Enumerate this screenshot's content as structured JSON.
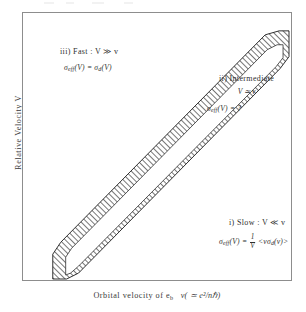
{
  "figure": {
    "type": "schematic-diagram",
    "axes": {
      "y_label": "Relative Velocity V",
      "x_label_text": "Orbital velocity of e",
      "x_label_subscript": "b",
      "x_label_expression": "v( ≃ e²/nℏ)"
    },
    "regions": [
      {
        "id": "fast",
        "numeral": "iii) Fast :",
        "condition": "V ≫ v",
        "title": "iii) Fast : V ≫ v",
        "formula_lhs": "σ",
        "formula_lhs_sub": "eff",
        "formula": "σeff(V) = σd(V)",
        "formula_rhs": "σ",
        "formula_rhs_sub": "d",
        "formula_arg": "(V)",
        "position": "upper-left"
      },
      {
        "id": "intermediate",
        "numeral": "ii) Intermediate",
        "condition": "V ≃ v",
        "title": "ii) Intermediate",
        "formula": "σeff(V) = ?",
        "formula_lhs": "σ",
        "formula_lhs_sub": "eff",
        "formula_arg": "(V)",
        "formula_rhs": "?",
        "position": "center-diagonal-band"
      },
      {
        "id": "slow",
        "numeral": "i) Slow :",
        "condition": "V ≪ v",
        "title": "i) Slow : V ≪ v",
        "formula": "σeff(V) = (1/V)⟨vσd(v)⟩",
        "formula_lhs": "σ",
        "formula_lhs_sub": "eff",
        "formula_arg": "(V)",
        "fraction_numerator": "1",
        "fraction_denominator": "V",
        "bracket_expr": "⟨ vσd(v) ⟩",
        "position": "lower-right"
      }
    ],
    "band": {
      "description": "diagonal hatched band running lower-left to upper-right separating fast and slow regimes",
      "hatch_color": "#5a5a5a",
      "outline_color": "#2f2f2f"
    },
    "frame_color": "#8d8d8d"
  }
}
